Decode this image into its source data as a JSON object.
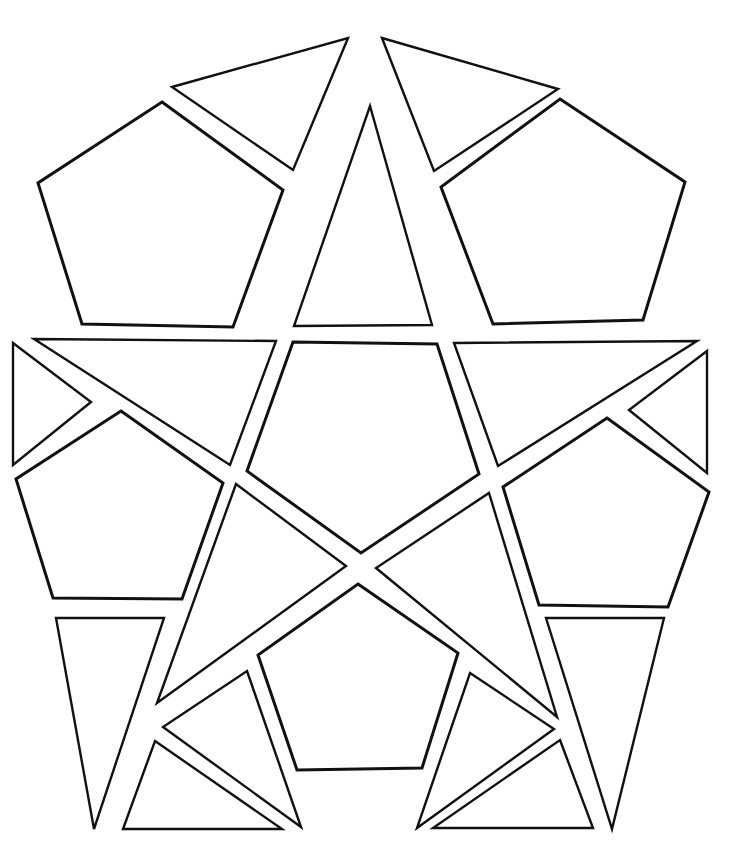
{
  "diagram": {
    "title": "",
    "background": "#ffffff",
    "stroke_color": "#111111",
    "shapes": [
      {
        "id": "top-left-triangle",
        "type": "triangle",
        "points": "172,87 348,38 293,170"
      },
      {
        "id": "top-right-triangle",
        "type": "triangle",
        "points": "382,38 558,89 434,171"
      },
      {
        "id": "top-left-pentagon",
        "type": "pentagon",
        "points": "162,102 283,190 233,327 82,324 38,183"
      },
      {
        "id": "top-center-triangle",
        "type": "triangle",
        "points": "370,106 432,325 294,326"
      },
      {
        "id": "top-right-pentagon",
        "type": "pentagon",
        "points": "560,99 685,182 643,320 493,324 441,187"
      },
      {
        "id": "left-small-triangle",
        "type": "triangle",
        "points": "13,343 91,402 13,465"
      },
      {
        "id": "left-upper-triangle",
        "type": "triangle",
        "points": "34,339 276,341 230,465"
      },
      {
        "id": "center-top-pentagon",
        "type": "pentagon",
        "points": "293,342 437,344 479,474 361,553 247,471"
      },
      {
        "id": "right-upper-triangle",
        "type": "triangle",
        "points": "454,343 697,341 498,466"
      },
      {
        "id": "right-small-triangle",
        "type": "triangle",
        "points": "707,351 629,410 707,473"
      },
      {
        "id": "left-pentagon",
        "type": "pentagon",
        "points": "121,411 223,483 182,599 53,598 16,479"
      },
      {
        "id": "right-pentagon",
        "type": "pentagon",
        "points": "607,418 709,492 668,607 539,605 503,487"
      },
      {
        "id": "left-center-triangle",
        "type": "triangle",
        "points": "236,484 346,566 157,703"
      },
      {
        "id": "right-center-triangle",
        "type": "triangle",
        "points": "489,493 557,717 376,568"
      },
      {
        "id": "bottom-center-pentagon",
        "type": "pentagon",
        "points": "358,584 458,653 422,768 297,770 258,655"
      },
      {
        "id": "left-down-triangle",
        "type": "triangle",
        "points": "56,618 164,618 94,829"
      },
      {
        "id": "right-down-triangle",
        "type": "triangle",
        "points": "546,618 664,618 612,829"
      },
      {
        "id": "center-left-triangle",
        "type": "triangle",
        "points": "247,671 301,827 163,727"
      },
      {
        "id": "center-right-triangle",
        "type": "triangle",
        "points": "470,673 554,729 417,828"
      },
      {
        "id": "bottom-left-triangle",
        "type": "triangle",
        "points": "155,741 282,829 123,829"
      },
      {
        "id": "bottom-right-triangle",
        "type": "triangle",
        "points": "560,740 593,828 433,828"
      }
    ]
  }
}
